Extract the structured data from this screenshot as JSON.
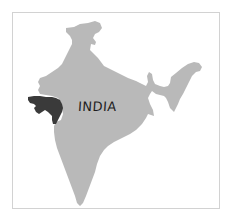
{
  "map": {
    "country_label": "INDIA",
    "highlighted_region": "Gujarat",
    "colors": {
      "country_fill": "#b9b9b9",
      "highlight_fill": "#3a3a3a",
      "frame_border": "#d2d2d2",
      "background": "#ffffff",
      "label": "#1e1e1e"
    }
  }
}
